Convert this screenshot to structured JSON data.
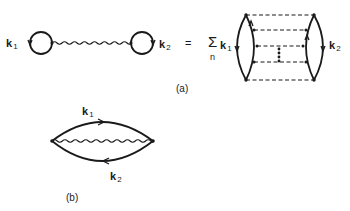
{
  "figure": {
    "panel_a": {
      "caption": "(a)",
      "lhs": {
        "left_loop_label": {
          "symbol": "k",
          "subscript": "1"
        },
        "right_loop_label": {
          "symbol": "k",
          "subscript": "2"
        },
        "connector": "wavy-interaction-line"
      },
      "equals": "=",
      "sum": {
        "symbol": "Σ",
        "index": "n"
      },
      "rhs": {
        "left_label": {
          "symbol": "k",
          "subscript": "1"
        },
        "right_label": {
          "symbol": "k",
          "subscript": "2"
        },
        "ladder_rungs": 5,
        "rung_style": "dashed",
        "ellipsis": "vertical-dots"
      }
    },
    "panel_b": {
      "caption": "(b)",
      "upper_label": {
        "symbol": "k",
        "subscript": "1"
      },
      "lower_label": {
        "symbol": "k",
        "subscript": "2"
      },
      "connector": "wavy-interaction-line"
    },
    "colors": {
      "ink": "#1a1a1a",
      "background": "#ffffff"
    }
  }
}
